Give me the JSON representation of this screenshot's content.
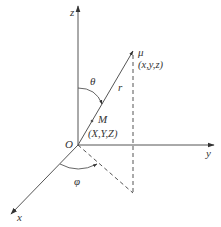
{
  "diagram": {
    "labels": {
      "z_axis": "z",
      "y_axis": "y",
      "x_axis": "x",
      "origin": "O",
      "theta": "θ",
      "phi": "φ",
      "r": "r",
      "point_mu": "μ",
      "point_mu_coords": "(x,y,z)",
      "point_M": "M",
      "point_M_coords": "(X,Y,Z)"
    },
    "colors": {
      "line": "#555555",
      "text": "#333333",
      "background": "#ffffff"
    }
  }
}
